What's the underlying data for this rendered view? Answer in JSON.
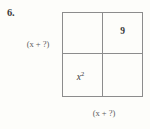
{
  "problem": {
    "number_label": "6."
  },
  "labels": {
    "left_side": "(x + ?)",
    "bottom_side": "(x + ?)"
  },
  "area_model": {
    "rows": 2,
    "cols": 2,
    "cells": [
      {
        "position": "top-left",
        "value": "",
        "exponent": ""
      },
      {
        "position": "top-right",
        "value": "9",
        "exponent": ""
      },
      {
        "position": "bottom-left",
        "value": "x",
        "exponent": "2"
      },
      {
        "position": "bottom-right",
        "value": "",
        "exponent": ""
      }
    ]
  },
  "colors": {
    "background": "#fdfdfa",
    "border": "#8c8c8c",
    "text": "#3a3a3a",
    "label_text": "#5c5c5c"
  }
}
